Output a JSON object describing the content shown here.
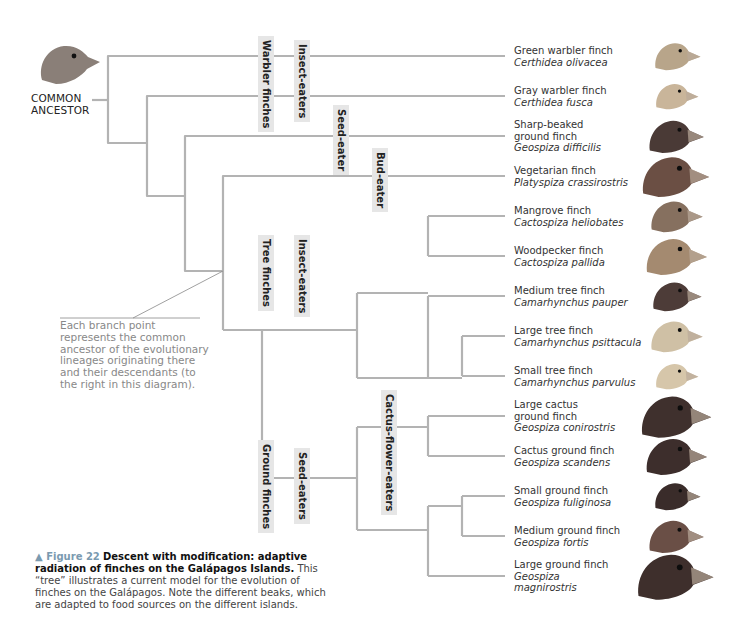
{
  "ancestor": {
    "label_line1": "COMMON",
    "label_line2": "ANCESTOR"
  },
  "colors": {
    "branch": "#b3b3b3",
    "label_bg": "#e6e6e6",
    "annotation_text": "#888888",
    "figure_label": "#7a9ab0"
  },
  "clade_labels": [
    {
      "id": "warbler-finches",
      "text": "Warbler finches",
      "x": 258,
      "y": 36,
      "h": 50
    },
    {
      "id": "insect-eaters-warbler",
      "text": "Insect-eaters",
      "x": 294,
      "y": 40,
      "h": 40
    },
    {
      "id": "seed-eater",
      "text": "Seed-eater",
      "x": 333,
      "y": 105,
      "h": 40
    },
    {
      "id": "bud-eater",
      "text": "Bud-eater",
      "x": 372,
      "y": 148,
      "h": 40
    },
    {
      "id": "tree-finches",
      "text": "Tree finches",
      "x": 258,
      "y": 235,
      "h": 70
    },
    {
      "id": "insect-eaters-tree",
      "text": "Insect-eaters",
      "x": 294,
      "y": 235,
      "h": 70
    },
    {
      "id": "ground-finches",
      "text": "Ground finches",
      "x": 258,
      "y": 440,
      "h": 82
    },
    {
      "id": "seed-eaters-ground",
      "text": "Seed-eaters",
      "x": 294,
      "y": 448,
      "h": 62
    },
    {
      "id": "cactus-flower-eaters",
      "text": "Cactus-flower-eaters",
      "x": 381,
      "y": 390,
      "h": 78
    }
  ],
  "species": [
    {
      "common": "Green warbler finch",
      "scientific": "Certhidea olivacea",
      "y": 56,
      "color": "#b8a58a",
      "size": 30
    },
    {
      "common": "Gray warbler finch",
      "scientific": "Certhidea fusca",
      "y": 96,
      "color": "#c9b59a",
      "size": 28
    },
    {
      "common": "Sharp-beaked ground finch",
      "scientific": "Geospiza difficilis",
      "y": 136,
      "color": "#4a3a36",
      "size": 36
    },
    {
      "common": "Vegetarian finch",
      "scientific": "Platyspiza crassirostris",
      "y": 176,
      "color": "#6b4f44",
      "size": 44
    },
    {
      "common": "Mangrove finch",
      "scientific": "Cactospiza heliobates",
      "y": 216,
      "color": "#86705f",
      "size": 34
    },
    {
      "common": "Woodpecker finch",
      "scientific": "Cactospiza pallida",
      "y": 256,
      "color": "#a48a70",
      "size": 40
    },
    {
      "common": "Medium tree finch",
      "scientific": "Camarhynchus pauper",
      "y": 296,
      "color": "#4d3c38",
      "size": 32
    },
    {
      "common": "Large tree finch",
      "scientific": "Camarhynchus psittacula",
      "y": 336,
      "color": "#cfc0a5",
      "size": 34
    },
    {
      "common": "Small tree finch",
      "scientific": "Camarhynchus parvulus",
      "y": 376,
      "color": "#d6c6aa",
      "size": 28
    },
    {
      "common": "Large cactus ground finch",
      "scientific": "Geospiza conirostris",
      "y": 416,
      "color": "#3f302d",
      "size": 46
    },
    {
      "common": "Cactus ground finch",
      "scientific": "Geospiza scandens",
      "y": 456,
      "color": "#3d2e2c",
      "size": 40
    },
    {
      "common": "Small ground finch",
      "scientific": "Geospiza fuliginosa",
      "y": 496,
      "color": "#3a2c2a",
      "size": 30
    },
    {
      "common": "Medium ground finch",
      "scientific": "Geospiza fortis",
      "y": 536,
      "color": "#6a4f46",
      "size": 36
    },
    {
      "common": "Large ground finch",
      "scientific": "Geospiza magnirostris",
      "y": 576,
      "color": "#3e2f2c",
      "size": 50
    }
  ],
  "species_lines": {
    "0": [
      "Green warbler finch",
      "Certhidea olivacea"
    ],
    "1": [
      "Gray warbler finch",
      "Certhidea fusca"
    ],
    "2": [
      "Sharp-beaked",
      "ground finch",
      "Geospiza difficilis"
    ],
    "3": [
      "Vegetarian finch",
      "Platyspiza crassirostris"
    ],
    "4": [
      "Mangrove finch",
      "Cactospiza heliobates"
    ],
    "5": [
      "Woodpecker finch",
      "Cactospiza pallida"
    ],
    "6": [
      "Medium tree finch",
      "Camarhynchus pauper"
    ],
    "7": [
      "Large tree finch",
      "Camarhynchus psittacula"
    ],
    "8": [
      "Small tree finch",
      "Camarhynchus parvulus"
    ],
    "9": [
      "Large cactus",
      "ground finch",
      "Geospiza conirostris"
    ],
    "10": [
      "Cactus ground finch",
      "Geospiza scandens"
    ],
    "11": [
      "Small ground finch",
      "Geospiza fuliginosa"
    ],
    "12": [
      "Medium ground finch",
      "Geospiza fortis"
    ],
    "13": [
      "Large ground finch",
      "Geospiza",
      "magnirostris"
    ]
  },
  "annotation": {
    "text": "Each branch point represents the common ancestor of the evolutionary lineages originating there and their descendants (to the right in this diagram)."
  },
  "caption": {
    "marker": "▲ Figure 22",
    "title": "Descent with modification: adaptive radiation of finches on the Galápagos Islands.",
    "body": "This “tree” illustrates a current model for the evolution of finches on the Galápagos. Note the different beaks, which are adapted to food sources on the different islands."
  }
}
